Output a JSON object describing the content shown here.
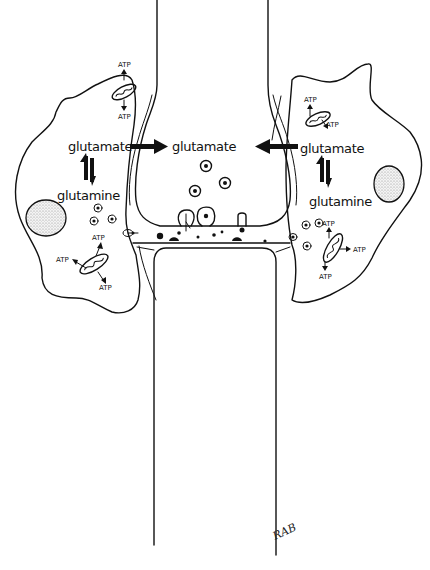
{
  "diagram": {
    "type": "tripartite synapse / glutamate-glutamine cycle (hand-drawn)",
    "colors": {
      "ink": "#111111",
      "background": "#ffffff",
      "nucleus_stipple": "#999999"
    },
    "center": {
      "label": "glutamate"
    },
    "left_astrocyte": {
      "top_label": "glutamate",
      "bottom_label": "glutamine",
      "atp_labels": [
        "ATP",
        "ATP",
        "ATP",
        "ATP",
        "ATP"
      ]
    },
    "right_astrocyte": {
      "top_label": "glutamate",
      "bottom_label": "glutamine",
      "atp_labels": [
        "ATP",
        "ATP",
        "ATP",
        "ATP",
        "ATP"
      ]
    },
    "signature": "RAB"
  }
}
